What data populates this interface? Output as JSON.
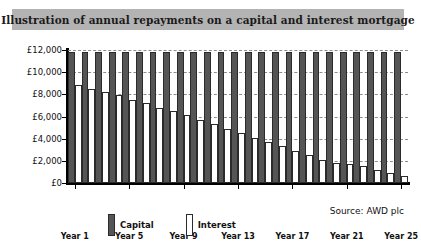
{
  "title": "Illustration of annual repayments on a capital and interest mortgage",
  "source_note": "Source: AWD plc",
  "legend": {
    "items": [
      {
        "label": "Capital",
        "swatch": "dark-filled-swatch",
        "color": "#555555"
      },
      {
        "label": "Interest",
        "swatch": "white-outlined-swatch",
        "color": "#ffffff"
      }
    ]
  },
  "axis": {
    "y_ticks": [
      "£0",
      "£2,000",
      "£4,000",
      "£6,000",
      "£8,000",
      "£10,000",
      "£12,000"
    ],
    "x_ticks": [
      "Year 1",
      "Year 5",
      "Year 9",
      "Year 13",
      "Year 17",
      "Year 21",
      "Year 25"
    ]
  },
  "chart_data": {
    "type": "bar",
    "title": "Illustration of annual repayments on a capital and interest mortgage",
    "xlabel": "",
    "ylabel": "",
    "ylim": [
      0,
      12000
    ],
    "ytick_step": 2000,
    "grid": true,
    "grid_style": "dashed-horizontal",
    "legend_position": "bottom-left",
    "categories": [
      "Year 1",
      "Year 2",
      "Year 3",
      "Year 4",
      "Year 5",
      "Year 6",
      "Year 7",
      "Year 8",
      "Year 9",
      "Year 10",
      "Year 11",
      "Year 12",
      "Year 13",
      "Year 14",
      "Year 15",
      "Year 16",
      "Year 17",
      "Year 18",
      "Year 19",
      "Year 20",
      "Year 21",
      "Year 22",
      "Year 23",
      "Year 24",
      "Year 25"
    ],
    "series": [
      {
        "name": "Capital",
        "color": "#555555",
        "values": [
          11800,
          11800,
          11800,
          11800,
          11800,
          11800,
          11800,
          11800,
          11800,
          11800,
          11800,
          11800,
          11800,
          11800,
          11800,
          11800,
          11800,
          11800,
          11800,
          11800,
          11800,
          11800,
          11800,
          11800,
          11800
        ]
      },
      {
        "name": "Interest",
        "color": "#ffffff",
        "values": [
          8800,
          8500,
          8200,
          7900,
          7500,
          7200,
          6800,
          6500,
          6100,
          5700,
          5300,
          4900,
          4500,
          4100,
          3700,
          3300,
          2900,
          2500,
          2100,
          1800,
          1700,
          1500,
          1200,
          900,
          600
        ]
      }
    ]
  }
}
